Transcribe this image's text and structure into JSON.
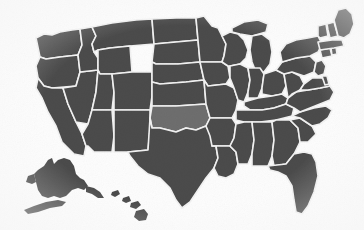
{
  "map": {
    "title": "United States Map",
    "type": "choropleth",
    "projection": "albers-usa",
    "background_color": "#fdfdfd",
    "default_state_color": "#4b4b4b",
    "highlight_state_color": "#6e6e6e",
    "border_color": "#f2f2f2",
    "highlighted_states": [
      "Oklahoma"
    ],
    "insets": [
      {
        "name": "Alaska",
        "abbr": "AK",
        "color": "#4b4b4b"
      },
      {
        "name": "Hawaii",
        "abbr": "HI",
        "color": "#4b4b4b"
      }
    ],
    "states": [
      {
        "abbr": "WA",
        "name": "Washington",
        "highlighted": false
      },
      {
        "abbr": "OR",
        "name": "Oregon",
        "highlighted": false
      },
      {
        "abbr": "CA",
        "name": "California",
        "highlighted": false
      },
      {
        "abbr": "NV",
        "name": "Nevada",
        "highlighted": false
      },
      {
        "abbr": "ID",
        "name": "Idaho",
        "highlighted": false
      },
      {
        "abbr": "MT",
        "name": "Montana",
        "highlighted": false
      },
      {
        "abbr": "WY",
        "name": "Wyoming",
        "highlighted": false
      },
      {
        "abbr": "UT",
        "name": "Utah",
        "highlighted": false
      },
      {
        "abbr": "AZ",
        "name": "Arizona",
        "highlighted": false
      },
      {
        "abbr": "CO",
        "name": "Colorado",
        "highlighted": false
      },
      {
        "abbr": "NM",
        "name": "New Mexico",
        "highlighted": false
      },
      {
        "abbr": "ND",
        "name": "North Dakota",
        "highlighted": false
      },
      {
        "abbr": "SD",
        "name": "South Dakota",
        "highlighted": false
      },
      {
        "abbr": "NE",
        "name": "Nebraska",
        "highlighted": false
      },
      {
        "abbr": "KS",
        "name": "Kansas",
        "highlighted": false
      },
      {
        "abbr": "OK",
        "name": "Oklahoma",
        "highlighted": true
      },
      {
        "abbr": "TX",
        "name": "Texas",
        "highlighted": false
      },
      {
        "abbr": "MN",
        "name": "Minnesota",
        "highlighted": false
      },
      {
        "abbr": "IA",
        "name": "Iowa",
        "highlighted": false
      },
      {
        "abbr": "MO",
        "name": "Missouri",
        "highlighted": false
      },
      {
        "abbr": "AR",
        "name": "Arkansas",
        "highlighted": false
      },
      {
        "abbr": "LA",
        "name": "Louisiana",
        "highlighted": false
      },
      {
        "abbr": "WI",
        "name": "Wisconsin",
        "highlighted": false
      },
      {
        "abbr": "IL",
        "name": "Illinois",
        "highlighted": false
      },
      {
        "abbr": "MS",
        "name": "Mississippi",
        "highlighted": false
      },
      {
        "abbr": "MI",
        "name": "Michigan",
        "highlighted": false
      },
      {
        "abbr": "IN",
        "name": "Indiana",
        "highlighted": false
      },
      {
        "abbr": "OH",
        "name": "Ohio",
        "highlighted": false
      },
      {
        "abbr": "KY",
        "name": "Kentucky",
        "highlighted": false
      },
      {
        "abbr": "TN",
        "name": "Tennessee",
        "highlighted": false
      },
      {
        "abbr": "AL",
        "name": "Alabama",
        "highlighted": false
      },
      {
        "abbr": "GA",
        "name": "Georgia",
        "highlighted": false
      },
      {
        "abbr": "FL",
        "name": "Florida",
        "highlighted": false
      },
      {
        "abbr": "SC",
        "name": "South Carolina",
        "highlighted": false
      },
      {
        "abbr": "NC",
        "name": "North Carolina",
        "highlighted": false
      },
      {
        "abbr": "VA",
        "name": "Virginia",
        "highlighted": false
      },
      {
        "abbr": "WV",
        "name": "West Virginia",
        "highlighted": false
      },
      {
        "abbr": "MD",
        "name": "Maryland",
        "highlighted": false
      },
      {
        "abbr": "DE",
        "name": "Delaware",
        "highlighted": false
      },
      {
        "abbr": "PA",
        "name": "Pennsylvania",
        "highlighted": false
      },
      {
        "abbr": "NJ",
        "name": "New Jersey",
        "highlighted": false
      },
      {
        "abbr": "NY",
        "name": "New York",
        "highlighted": false
      },
      {
        "abbr": "CT",
        "name": "Connecticut",
        "highlighted": false
      },
      {
        "abbr": "RI",
        "name": "Rhode Island",
        "highlighted": false
      },
      {
        "abbr": "MA",
        "name": "Massachusetts",
        "highlighted": false
      },
      {
        "abbr": "VT",
        "name": "Vermont",
        "highlighted": false
      },
      {
        "abbr": "NH",
        "name": "New Hampshire",
        "highlighted": false
      },
      {
        "abbr": "ME",
        "name": "Maine",
        "highlighted": false
      }
    ]
  }
}
